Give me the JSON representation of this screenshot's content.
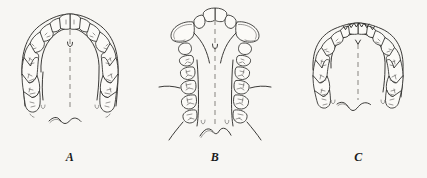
{
  "figure": {
    "background_color": "#f7f6f3",
    "ink_color": "#262523",
    "panel_count": 3
  },
  "panels": [
    {
      "id": "panel-a",
      "caption": "A",
      "arch_type": "ovoid",
      "description": "Normal ovoid maxillary arch with evenly aligned teeth and rounded anterior curve",
      "tooth_count": 14,
      "has_midline": true,
      "has_palatal_raphe": true
    },
    {
      "id": "panel-b",
      "caption": "B",
      "arch_type": "v-shaped",
      "description": "V-shaped contracted arch with protruding central incisors and prominent fan-shaped canines",
      "tooth_count": 14,
      "has_midline": true,
      "has_palatal_raphe": true
    },
    {
      "id": "panel-c",
      "caption": "C",
      "arch_type": "square",
      "description": "Square tapered arch with pointed mamelonated incisal edges",
      "tooth_count": 14,
      "has_midline": true,
      "has_palatal_raphe": true
    }
  ],
  "captions": {
    "a": "A",
    "b": "B",
    "c": "C"
  }
}
